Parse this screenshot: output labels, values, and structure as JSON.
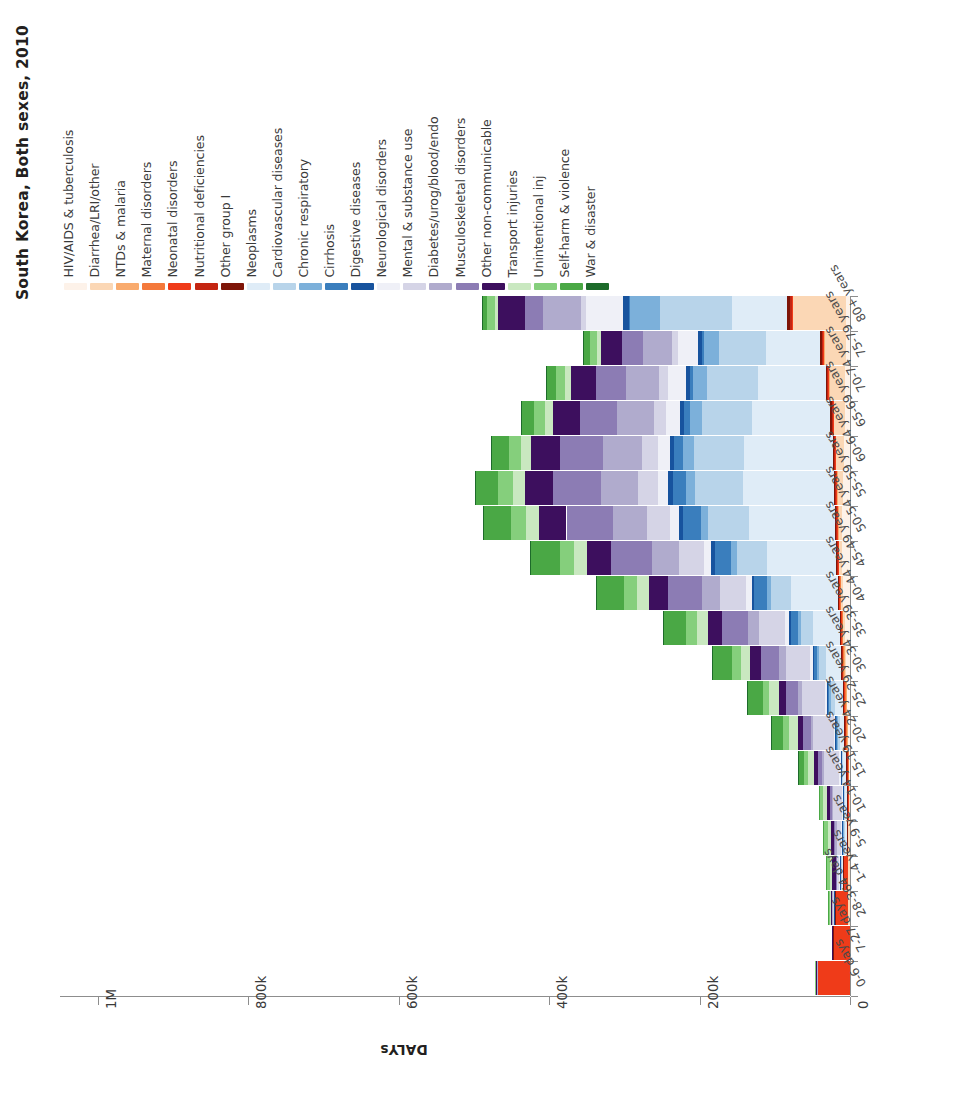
{
  "title": "South Korea, Both sexes, 2010",
  "value_axis": {
    "label": "DALYs",
    "ticks": [
      "1M",
      "800k",
      "600k",
      "400k",
      "200k",
      "0"
    ],
    "tick_values": [
      1000000,
      800000,
      600000,
      400000,
      200000,
      0
    ],
    "max": 1050000
  },
  "legend": {
    "items": [
      {
        "label": "HIV/AIDS & tuberculosis",
        "color": "#fdf2e9"
      },
      {
        "label": "Diarrhea/LRI/other",
        "color": "#fbd7b5"
      },
      {
        "label": "NTDs & malaria",
        "color": "#f9ab6e"
      },
      {
        "label": "Maternal disorders",
        "color": "#f4793b"
      },
      {
        "label": "Neonatal disorders",
        "color": "#ef3b19"
      },
      {
        "label": "Nutritional deficiencies",
        "color": "#c42511"
      },
      {
        "label": "Other group I",
        "color": "#7e1508"
      },
      {
        "label": "Neoplasms",
        "color": "#dfecf7"
      },
      {
        "label": "Cardiovascular diseases",
        "color": "#b8d4ea"
      },
      {
        "label": "Chronic respiratory",
        "color": "#7cb0da"
      },
      {
        "label": "Cirrhosis",
        "color": "#3a7ebd"
      },
      {
        "label": "Digestive diseases",
        "color": "#17539e"
      },
      {
        "label": "Neurological disorders",
        "color": "#eff0f7"
      },
      {
        "label": "Mental & substance use",
        "color": "#d5d4e6"
      },
      {
        "label": "Diabetes/urog/blood/endo",
        "color": "#b0abcd"
      },
      {
        "label": "Musculoskeletal disorders",
        "color": "#8c7cb4"
      },
      {
        "label": "Other non-communicable",
        "color": "#3d0f5e"
      },
      {
        "label": "Transport injuries",
        "color": "#c9e8c0"
      },
      {
        "label": "Unintentional inj",
        "color": "#85cf7c"
      },
      {
        "label": "Self-harm & violence",
        "color": "#4aa845"
      },
      {
        "label": "War & disaster",
        "color": "#1d6b2a"
      }
    ]
  },
  "chart_data": {
    "type": "bar",
    "orientation": "horizontal",
    "stacked": true,
    "title": "South Korea, Both sexes, 2010",
    "xlabel": "DALYs",
    "ylabel": "",
    "xlim": [
      0,
      1050000
    ],
    "grid": false,
    "legend_position": "top",
    "categories": [
      "0-6 days",
      "7-27 days",
      "28-364 days",
      "1-4 years",
      "5-9 years",
      "10-14 years",
      "15-19 years",
      "20-24 years",
      "25-29 years",
      "30-34 years",
      "35-39 years",
      "40-44 years",
      "45-49 years",
      "50-54 years",
      "55-59 years",
      "60-64 years",
      "65-69 years",
      "70-74 years",
      "75-79 years",
      "80+ years"
    ],
    "series": [
      {
        "name": "HIV/AIDS & tuberculosis",
        "color": "#fdf2e9",
        "values": [
          0,
          0,
          200,
          200,
          300,
          400,
          1200,
          2500,
          3500,
          5000,
          7000,
          9000,
          10000,
          10000,
          9000,
          8000,
          7000,
          6000,
          5000,
          5000
        ]
      },
      {
        "name": "Diarrhea/LRI/other",
        "color": "#fbd7b5",
        "values": [
          300,
          200,
          2000,
          2500,
          2000,
          1500,
          1500,
          1800,
          2000,
          2500,
          3000,
          4000,
          5000,
          6000,
          8000,
          11000,
          15000,
          22000,
          30000,
          72000
        ]
      },
      {
        "name": "NTDs & malaria",
        "color": "#f9ab6e",
        "values": [
          0,
          0,
          100,
          100,
          100,
          100,
          100,
          150,
          200,
          250,
          300,
          350,
          400,
          400,
          400,
          350,
          300,
          250,
          200,
          200
        ]
      },
      {
        "name": "Maternal disorders",
        "color": "#f4793b",
        "values": [
          0,
          0,
          0,
          0,
          0,
          0,
          200,
          900,
          1600,
          1500,
          700,
          200,
          0,
          0,
          0,
          0,
          0,
          0,
          0,
          0
        ]
      },
      {
        "name": "Neonatal disorders",
        "color": "#ef3b19",
        "values": [
          43000,
          22000,
          17000,
          5500,
          1500,
          1200,
          1200,
          1200,
          1200,
          1200,
          1200,
          1200,
          1000,
          900,
          800,
          700,
          600,
          500,
          400,
          300
        ]
      },
      {
        "name": "Nutritional deficiencies",
        "color": "#c42511",
        "values": [
          0,
          0,
          300,
          400,
          300,
          300,
          300,
          400,
          500,
          600,
          700,
          800,
          900,
          1000,
          1100,
          1200,
          1300,
          1400,
          1500,
          2500
        ]
      },
      {
        "name": "Other group I",
        "color": "#7e1508",
        "values": [
          500,
          200,
          400,
          400,
          300,
          300,
          300,
          400,
          500,
          600,
          700,
          900,
          1100,
          1300,
          1500,
          1700,
          2000,
          2300,
          2600,
          4000
        ]
      },
      {
        "name": "Neoplasms",
        "color": "#dfecf7",
        "values": [
          0,
          0,
          800,
          2500,
          3000,
          3000,
          4000,
          6000,
          11000,
          20000,
          36000,
          62000,
          92000,
          115000,
          122000,
          118000,
          104000,
          90000,
          72000,
          73000
        ]
      },
      {
        "name": "Cardiovascular diseases",
        "color": "#b8d4ea",
        "values": [
          0,
          0,
          300,
          500,
          600,
          700,
          1500,
          3000,
          5000,
          9000,
          16000,
          27000,
          40000,
          54000,
          63000,
          67000,
          67000,
          67000,
          62000,
          96000
        ]
      },
      {
        "name": "Chronic respiratory",
        "color": "#7cb0da",
        "values": [
          0,
          0,
          200,
          700,
          1600,
          1500,
          1500,
          1800,
          2200,
          3000,
          4000,
          5500,
          7500,
          10000,
          12000,
          14000,
          16000,
          19000,
          21000,
          39000
        ]
      },
      {
        "name": "Cirrhosis",
        "color": "#3a7ebd",
        "values": [
          0,
          0,
          0,
          100,
          100,
          100,
          200,
          600,
          1600,
          4000,
          9000,
          16000,
          22000,
          23000,
          18000,
          12000,
          7000,
          4000,
          2000,
          1500
        ]
      },
      {
        "name": "Digestive diseases",
        "color": "#17539e",
        "values": [
          0,
          0,
          200,
          200,
          200,
          200,
          300,
          600,
          1000,
          1600,
          2400,
          3400,
          4400,
          5200,
          5600,
          5800,
          5800,
          5800,
          5400,
          8000
        ]
      },
      {
        "name": "Neurological disorders",
        "color": "#eff0f7",
        "values": [
          0,
          0,
          900,
          1600,
          1800,
          1800,
          2000,
          2500,
          3200,
          4200,
          5600,
          7400,
          9600,
          12000,
          14000,
          16000,
          19000,
          23000,
          26000,
          50000
        ]
      },
      {
        "name": "Mental & substance use",
        "color": "#d5d4e6",
        "values": [
          0,
          0,
          200,
          2000,
          6000,
          11000,
          20000,
          27000,
          30000,
          32000,
          34000,
          35000,
          34000,
          31000,
          26000,
          21000,
          16000,
          12000,
          8000,
          6000
        ]
      },
      {
        "name": "Diabetes/urog/blood/endo",
        "color": "#b0abcd",
        "values": [
          300,
          100,
          1200,
          1500,
          1800,
          2000,
          2500,
          3500,
          5500,
          9000,
          15000,
          24000,
          35000,
          45000,
          50000,
          51000,
          49000,
          45000,
          39000,
          50000
        ]
      },
      {
        "name": "Musculoskeletal disorders",
        "color": "#8c7cb4",
        "values": [
          0,
          0,
          100,
          600,
          1500,
          3000,
          6000,
          10000,
          16000,
          24000,
          34000,
          45000,
          55000,
          62000,
          63000,
          58000,
          49000,
          39000,
          28000,
          24000
        ]
      },
      {
        "name": "Other non-communicable",
        "color": "#3d0f5e",
        "values": [
          2500,
          800,
          3000,
          4500,
          4000,
          4000,
          5000,
          7000,
          10000,
          14000,
          19000,
          25000,
          31000,
          36000,
          38000,
          38000,
          36000,
          33000,
          28000,
          36000
        ]
      },
      {
        "name": "Transport injuries",
        "color": "#c9e8c0",
        "values": [
          0,
          0,
          300,
          3000,
          4500,
          4500,
          8000,
          12000,
          12000,
          13000,
          15000,
          17000,
          18000,
          18000,
          16000,
          13000,
          10000,
          8000,
          5000,
          4000
        ]
      },
      {
        "name": "Unintentional inj",
        "color": "#85cf7c",
        "values": [
          300,
          100,
          2000,
          5000,
          5000,
          4500,
          6000,
          8000,
          9000,
          11000,
          14000,
          17000,
          19000,
          20000,
          19000,
          17000,
          15000,
          13000,
          10000,
          11000
        ]
      },
      {
        "name": "Self-harm & violence",
        "color": "#4aa845",
        "values": [
          0,
          0,
          300,
          700,
          900,
          1500,
          7000,
          16000,
          21000,
          26000,
          31000,
          36000,
          38000,
          36000,
          30000,
          23000,
          17000,
          13000,
          9000,
          7000
        ]
      },
      {
        "name": "War & disaster",
        "color": "#1d6b2a",
        "values": [
          0,
          0,
          0,
          100,
          100,
          100,
          200,
          300,
          400,
          500,
          600,
          700,
          800,
          800,
          700,
          600,
          500,
          400,
          300,
          200
        ]
      }
    ]
  }
}
